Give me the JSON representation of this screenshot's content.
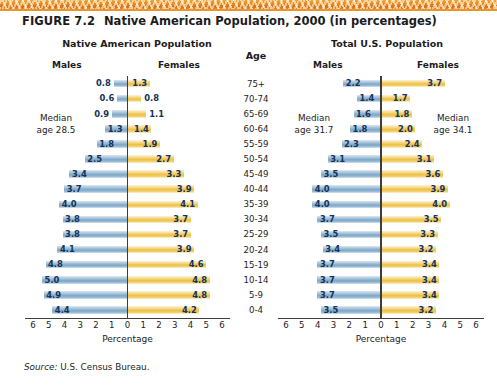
{
  "figure": {
    "number": "FIGURE 7.2",
    "title": "Native American Population, 2000 (in percentages)"
  },
  "headers": {
    "left_panel": "Native American Population",
    "right_panel": "Total U.S. Population",
    "age": "Age",
    "males": "Males",
    "females": "Females"
  },
  "annotations": {
    "left_median": "Median\nage 28.5",
    "left_median_line1": "Median",
    "left_median_line2": "age 28.5",
    "right_median_males_line1": "Median",
    "right_median_males_line2": "age 31.7",
    "right_median_females_line1": "Median",
    "right_median_females_line2": "age 34.1"
  },
  "axis": {
    "title": "Percentage",
    "ticks": [
      "6",
      "5",
      "4",
      "3",
      "2",
      "1",
      "0",
      "1",
      "2",
      "3",
      "4",
      "5",
      "6"
    ],
    "max": 6
  },
  "source": {
    "label": "Source:",
    "text": "U.S. Census Bureau."
  },
  "colors": {
    "male_bar": "#7ba7c7",
    "female_bar": "#eec043",
    "label_text": "#14325a",
    "axis": "#3d3d3d",
    "band_orange": "#e8871f"
  },
  "chart_data": [
    {
      "type": "bar",
      "title": "Native American Population",
      "subtype": "population-pyramid",
      "xlabel": "Percentage",
      "ylabel": "Age",
      "xlim": [
        0,
        6
      ],
      "grid": false,
      "legend": "none",
      "median_age_note": "Median age 28.5",
      "categories": [
        "75+",
        "70-74",
        "65-69",
        "60-64",
        "55-59",
        "50-54",
        "45-49",
        "40-44",
        "35-39",
        "30-34",
        "25-29",
        "20-24",
        "15-19",
        "10-14",
        "5-9",
        "0-4"
      ],
      "series": [
        {
          "name": "Males",
          "values": [
            0.8,
            0.6,
            0.9,
            1.3,
            1.8,
            2.5,
            3.4,
            3.7,
            4.0,
            3.8,
            3.8,
            4.1,
            4.8,
            5.0,
            4.9,
            4.4
          ]
        },
        {
          "name": "Females",
          "values": [
            1.3,
            0.8,
            1.1,
            1.4,
            1.9,
            2.7,
            3.3,
            3.9,
            4.1,
            3.7,
            3.7,
            3.9,
            4.6,
            4.8,
            4.8,
            4.2
          ]
        }
      ]
    },
    {
      "type": "bar",
      "title": "Total U.S. Population",
      "subtype": "population-pyramid",
      "xlabel": "Percentage",
      "ylabel": "Age",
      "xlim": [
        0,
        6
      ],
      "grid": false,
      "legend": "none",
      "median_age_note_males": "Median age 31.7",
      "median_age_note_females": "Median age 34.1",
      "categories": [
        "75+",
        "70-74",
        "65-69",
        "60-64",
        "55-59",
        "50-54",
        "45-49",
        "40-44",
        "35-39",
        "30-34",
        "25-29",
        "20-24",
        "15-19",
        "10-14",
        "5-9",
        "0-4"
      ],
      "series": [
        {
          "name": "Males",
          "values": [
            2.2,
            1.4,
            1.6,
            1.8,
            2.3,
            3.1,
            3.5,
            4.0,
            4.0,
            3.7,
            3.5,
            3.4,
            3.7,
            3.7,
            3.7,
            3.5
          ]
        },
        {
          "name": "Females",
          "values": [
            3.7,
            1.7,
            1.8,
            2.0,
            2.4,
            3.1,
            3.6,
            3.9,
            4.0,
            3.5,
            3.3,
            3.2,
            3.4,
            3.4,
            3.4,
            3.2
          ]
        }
      ]
    }
  ]
}
